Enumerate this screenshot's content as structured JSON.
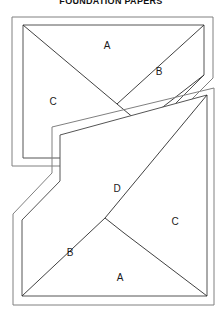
{
  "page": {
    "title": "FOUNDATION PAPERS",
    "background_color": "#ffffff",
    "line_color": "#4d4d4d",
    "inner_line_color": "#2b2b2b",
    "label_color": "#1a1a1a",
    "width": 222,
    "height": 326
  },
  "blocks": [
    {
      "name": "top-foundation-block",
      "labels": [
        {
          "text": "A",
          "x": 107,
          "y": 46
        },
        {
          "text": "B",
          "x": 159,
          "y": 72
        },
        {
          "text": "C",
          "x": 53,
          "y": 102
        }
      ],
      "outer_outline": "M12,17 L213,17 L213,78 L172,119 L172,166 L12,166 Z",
      "seam_outline": "M23,25 L204,25 L204,75 L166,113 L166,158 L23,158 Z",
      "piece_lines": [
        "M23,25 L117,104",
        "M117,104 L141,124",
        "M117,104 L204,25",
        "M141,124 L204,75"
      ]
    },
    {
      "name": "bottom-foundation-block",
      "labels": [
        {
          "text": "D",
          "x": 117,
          "y": 189
        },
        {
          "text": "C",
          "x": 175,
          "y": 222
        },
        {
          "text": "B",
          "x": 70,
          "y": 253
        },
        {
          "text": "A",
          "x": 120,
          "y": 278
        }
      ],
      "outer_outline": "M13,214 L52,173 L52,127 L214,88 L214,305 L13,305 Z",
      "seam_outline": "M22,220 L60,181 L60,135 L207,95 L207,296 L22,296 Z",
      "piece_lines": [
        "M22,296 L105,218",
        "M105,218 L124,233",
        "M105,218 L207,95",
        "M124,233 L207,296"
      ]
    }
  ]
}
